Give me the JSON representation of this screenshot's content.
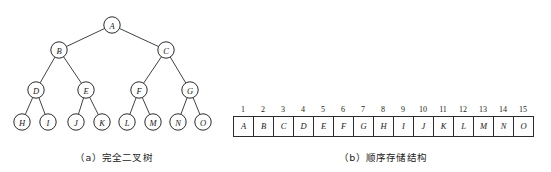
{
  "figure": {
    "scan_artifact_text": "·············  ·········· ·····   ······    ·······"
  },
  "tree": {
    "caption": "（a）完全二叉树",
    "node_radius": 8.2,
    "nodes": [
      {
        "id": "A",
        "label": "A",
        "x": 112,
        "y": 17,
        "level": 1,
        "index": 1
      },
      {
        "id": "B",
        "label": "B",
        "x": 59,
        "y": 42,
        "level": 2,
        "index": 2
      },
      {
        "id": "C",
        "label": "C",
        "x": 166,
        "y": 42,
        "level": 2,
        "index": 3
      },
      {
        "id": "D",
        "label": "D",
        "x": 36,
        "y": 82,
        "level": 3,
        "index": 4
      },
      {
        "id": "E",
        "label": "E",
        "x": 86,
        "y": 82,
        "level": 3,
        "index": 5
      },
      {
        "id": "F",
        "label": "F",
        "x": 139,
        "y": 82,
        "level": 3,
        "index": 6
      },
      {
        "id": "G",
        "label": "G",
        "x": 190,
        "y": 82,
        "level": 3,
        "index": 7
      },
      {
        "id": "H",
        "label": "H",
        "x": 22,
        "y": 114,
        "level": 4,
        "index": 8
      },
      {
        "id": "I",
        "label": "I",
        "x": 48,
        "y": 114,
        "level": 4,
        "index": 9
      },
      {
        "id": "J",
        "label": "J",
        "x": 76,
        "y": 114,
        "level": 4,
        "index": 10
      },
      {
        "id": "K",
        "label": "K",
        "x": 102,
        "y": 114,
        "level": 4,
        "index": 11
      },
      {
        "id": "L",
        "label": "L",
        "x": 127,
        "y": 114,
        "level": 4,
        "index": 12
      },
      {
        "id": "M",
        "label": "M",
        "x": 153,
        "y": 114,
        "level": 4,
        "index": 13
      },
      {
        "id": "N",
        "label": "N",
        "x": 178,
        "y": 114,
        "level": 4,
        "index": 14
      },
      {
        "id": "O",
        "label": "O",
        "x": 203,
        "y": 114,
        "level": 4,
        "index": 15
      }
    ],
    "edges": [
      [
        "A",
        "B"
      ],
      [
        "A",
        "C"
      ],
      [
        "B",
        "D"
      ],
      [
        "B",
        "E"
      ],
      [
        "C",
        "F"
      ],
      [
        "C",
        "G"
      ],
      [
        "D",
        "H"
      ],
      [
        "D",
        "I"
      ],
      [
        "E",
        "J"
      ],
      [
        "E",
        "K"
      ],
      [
        "F",
        "L"
      ],
      [
        "F",
        "M"
      ],
      [
        "G",
        "N"
      ],
      [
        "G",
        "O"
      ]
    ]
  },
  "array": {
    "caption": "（b）顺序存储结构",
    "indices": [
      "1",
      "2",
      "3",
      "4",
      "5",
      "6",
      "7",
      "8",
      "9",
      "10",
      "11",
      "12",
      "13",
      "14",
      "15"
    ],
    "values": [
      "A",
      "B",
      "C",
      "D",
      "E",
      "F",
      "G",
      "H",
      "I",
      "J",
      "K",
      "L",
      "M",
      "N",
      "O"
    ]
  },
  "colors": {
    "stroke": "#2b2b2b",
    "text": "#1a1a1a",
    "background": "#ffffff"
  }
}
